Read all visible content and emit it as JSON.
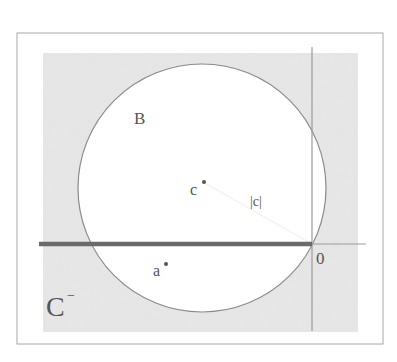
{
  "figure": {
    "labels": {
      "disk": "B",
      "center_point": "c",
      "radius": "|c|",
      "point_a": "a",
      "origin": "0",
      "region": "C",
      "region_superscript": "−"
    },
    "colors": {
      "frame": "#a8a8a8",
      "shade": "#d9d9d9",
      "circle": "#8a8a8a",
      "axis": "#9a9a9a",
      "thick_line": "#6a6a6a",
      "text": "#555555",
      "point": "#555555"
    },
    "geometry": {
      "frame": {
        "x": 17,
        "y": 33,
        "w": 366,
        "h": 311
      },
      "shaded_rect": {
        "x": 43,
        "y": 53,
        "w": 315,
        "h": 279
      },
      "circle": {
        "cx": 202,
        "cy": 188,
        "r": 124
      },
      "origin": {
        "x": 312,
        "y": 244
      },
      "point_c": {
        "x": 203,
        "y": 182
      },
      "point_a": {
        "x": 165,
        "y": 264
      },
      "thick_segment": {
        "x1": 39,
        "x2": 312,
        "y": 244
      },
      "x_axis": {
        "x1": 39,
        "x2": 366,
        "y": 244
      },
      "y_axis": {
        "x": 312,
        "y1": 47,
        "y2": 331
      }
    }
  }
}
